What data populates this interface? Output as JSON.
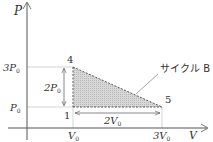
{
  "diagram": {
    "axes": {
      "y_label": "P",
      "x_label": "V",
      "y_ticks": [
        {
          "label_main": "3P",
          "label_sub": "0"
        },
        {
          "label_main": "P",
          "label_sub": "0"
        }
      ],
      "x_ticks": [
        {
          "label_main": "V",
          "label_sub": "0"
        },
        {
          "label_main": "3V",
          "label_sub": "0"
        }
      ]
    },
    "points": [
      {
        "id": "4",
        "label": "4",
        "P": "3P0",
        "V": "V0"
      },
      {
        "id": "1",
        "label": "1",
        "P": "P0",
        "V": "V0"
      },
      {
        "id": "5",
        "label": "5",
        "P": "P0",
        "V": "3V0"
      }
    ],
    "dimensions": {
      "vertical": {
        "label_main": "2P",
        "label_sub": "0"
      },
      "horizontal": {
        "label_main": "2V",
        "label_sub": "0"
      }
    },
    "cycle_label": "サイクル B",
    "colors": {
      "fill": "#cfcfcf",
      "line": "#555555",
      "guide": "#aaaaaa"
    }
  }
}
